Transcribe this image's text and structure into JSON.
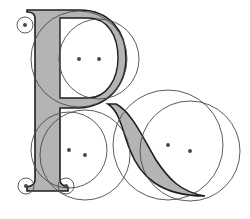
{
  "diagram": {
    "letter": "R",
    "colors": {
      "fill": "#b4b4b4",
      "stroke": "#1e1e1e",
      "guide_stroke": "#4a4a4a",
      "dot": "#4a4a4a",
      "background": "#ffffff"
    },
    "guide_circles": [
      {
        "name": "upper-left-large-circle",
        "cx": 79,
        "cy": 59,
        "r": 48
      },
      {
        "name": "upper-right-large-circle",
        "cx": 99,
        "cy": 59,
        "r": 40
      },
      {
        "name": "lower-left-circle-a",
        "cx": 69,
        "cy": 150,
        "r": 38
      },
      {
        "name": "lower-left-circle-b",
        "cx": 85,
        "cy": 155,
        "r": 45
      },
      {
        "name": "lower-right-circle-a",
        "cx": 168,
        "cy": 145,
        "r": 55
      },
      {
        "name": "lower-right-circle-b",
        "cx": 190,
        "cy": 151,
        "r": 50
      },
      {
        "name": "top-left-serif-circle",
        "cx": 25,
        "cy": 25,
        "r": 8
      },
      {
        "name": "bottom-left-serif-circle",
        "cx": 26,
        "cy": 186,
        "r": 8
      },
      {
        "name": "bottom-right-serif-circle",
        "cx": 66,
        "cy": 186,
        "r": 8
      }
    ],
    "center_dots": [
      {
        "cx": 79,
        "cy": 59
      },
      {
        "cx": 99,
        "cy": 59
      },
      {
        "cx": 69,
        "cy": 150
      },
      {
        "cx": 85,
        "cy": 155
      },
      {
        "cx": 168,
        "cy": 145
      },
      {
        "cx": 190,
        "cy": 151
      },
      {
        "cx": 25,
        "cy": 25
      },
      {
        "cx": 26,
        "cy": 186
      },
      {
        "cx": 66,
        "cy": 186
      }
    ]
  }
}
